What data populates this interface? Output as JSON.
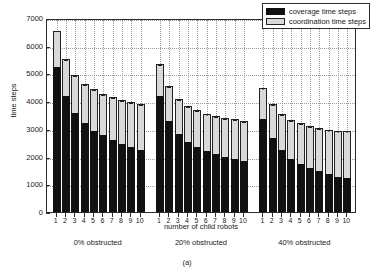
{
  "chart_data": {
    "type": "bar",
    "subtype": "stacked-grouped-bar-with-errorbars",
    "title": "",
    "caption": "(a)",
    "xlabel": "number of child robots",
    "ylabel": "time steps",
    "ylim": [
      0,
      7000
    ],
    "ytick_values": [
      0,
      1000,
      2000,
      3000,
      4000,
      5000,
      6000,
      7000
    ],
    "ytick_labels": [
      "0",
      "1000",
      "2000",
      "3000",
      "4000",
      "5000",
      "6000",
      "7000"
    ],
    "grid": true,
    "legend_position": "top-right",
    "legend": [
      {
        "label": "coverage time steps",
        "color": "#111111"
      },
      {
        "label": "coordination time steps",
        "color": "#d9d9d9"
      }
    ],
    "series_names": [
      "coverage time steps",
      "coordination time steps"
    ],
    "categories": [
      "1",
      "2",
      "3",
      "4",
      "5",
      "6",
      "7",
      "8",
      "9",
      "10"
    ],
    "groups": [
      {
        "name": "0% obstructed",
        "categories": [
          "1",
          "2",
          "3",
          "4",
          "5",
          "6",
          "7",
          "8",
          "9",
          "10"
        ],
        "coverage": [
          5230,
          4180,
          3580,
          3200,
          2930,
          2780,
          2590,
          2450,
          2330,
          2230
        ],
        "coordination": [
          1300,
          1340,
          1360,
          1430,
          1500,
          1480,
          1560,
          1590,
          1630,
          1670
        ],
        "totals": [
          6530,
          5520,
          4940,
          4630,
          4430,
          4260,
          4150,
          4040,
          3960,
          3900
        ],
        "error": [
          0,
          40,
          40,
          40,
          40,
          40,
          40,
          40,
          40,
          40
        ]
      },
      {
        "name": "20% obstructed",
        "categories": [
          "1",
          "2",
          "3",
          "4",
          "5",
          "6",
          "7",
          "8",
          "9",
          "10"
        ],
        "coverage": [
          4180,
          3300,
          2810,
          2530,
          2350,
          2200,
          2090,
          1990,
          1920,
          1850
        ],
        "coordination": [
          1150,
          1230,
          1270,
          1300,
          1320,
          1350,
          1380,
          1400,
          1420,
          1440
        ],
        "totals": [
          5330,
          4530,
          4080,
          3830,
          3670,
          3550,
          3470,
          3390,
          3340,
          3290
        ],
        "error": [
          60,
          50,
          45,
          45,
          45,
          45,
          45,
          45,
          45,
          45
        ]
      },
      {
        "name": "40% obstructed",
        "categories": [
          "1",
          "2",
          "3",
          "4",
          "5",
          "6",
          "7",
          "8",
          "9",
          "10"
        ],
        "coverage": [
          3350,
          2680,
          2220,
          1920,
          1720,
          1580,
          1470,
          1370,
          1280,
          1210
        ],
        "coordination": [
          1130,
          1200,
          1300,
          1400,
          1480,
          1520,
          1560,
          1600,
          1660,
          1720
        ],
        "totals": [
          4480,
          3880,
          3520,
          3320,
          3200,
          3100,
          3030,
          2970,
          2940,
          2930
        ],
        "error": [
          70,
          60,
          55,
          50,
          50,
          50,
          50,
          50,
          50,
          50
        ]
      }
    ]
  }
}
